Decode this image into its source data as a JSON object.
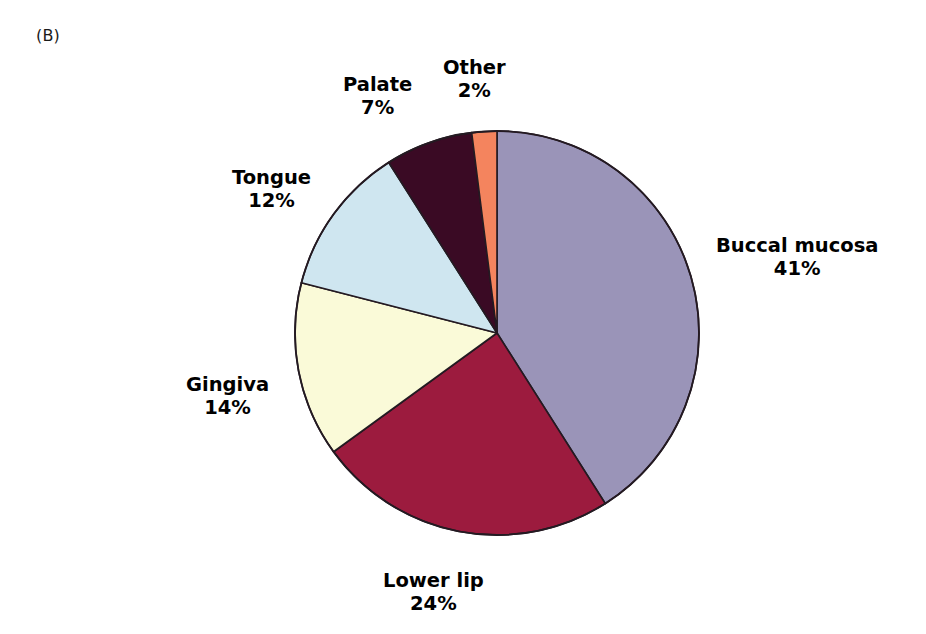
{
  "figure": {
    "panel_label": "(B)",
    "background_color": "#ffffff"
  },
  "chart_data": {
    "type": "pie",
    "title": "",
    "subtitle": "",
    "xlabel": "",
    "ylabel": "",
    "grid": false,
    "legend_position": "none",
    "label_format": "name + percent",
    "start_angle_deg": 0,
    "direction": "clockwise",
    "total_percent": 100,
    "categories": [
      "Buccal mucosa",
      "Lower lip",
      "Gingiva",
      "Tongue",
      "Palate",
      "Other"
    ],
    "values": [
      41,
      24,
      14,
      12,
      7,
      2
    ],
    "value_labels": [
      "41%",
      "24%",
      "14%",
      "12%",
      "7%",
      "2%"
    ],
    "colors": [
      "#9a94b8",
      "#9c1b3e",
      "#fafad8",
      "#cfe6f0",
      "#3a0a24",
      "#f4845e"
    ],
    "slice_outline_color": "#241a22",
    "slices": [
      {
        "name": "Buccal mucosa",
        "value": 41,
        "label": "Buccal mucosa",
        "percent": "41%",
        "color": "#9a94b8"
      },
      {
        "name": "Lower lip",
        "value": 24,
        "label": "Lower lip",
        "percent": "24%",
        "color": "#9c1b3e"
      },
      {
        "name": "Gingiva",
        "value": 14,
        "label": "Gingiva",
        "percent": "14%",
        "color": "#fafad8"
      },
      {
        "name": "Tongue",
        "value": 12,
        "label": "Tongue",
        "percent": "12%",
        "color": "#cfe6f0"
      },
      {
        "name": "Palate",
        "value": 7,
        "label": "Palate",
        "percent": "7%",
        "color": "#3a0a24"
      },
      {
        "name": "Other",
        "value": 2,
        "label": "Other",
        "percent": "2%",
        "color": "#f4845e"
      }
    ]
  }
}
